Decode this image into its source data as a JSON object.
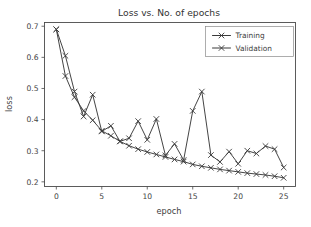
{
  "chart_data": {
    "type": "line",
    "title": "Loss vs. No. of epochs",
    "xlabel": "epoch",
    "ylabel": "loss",
    "xlim": [
      -1.3,
      26.3
    ],
    "ylim": [
      0.185,
      0.712
    ],
    "xticks": [
      0,
      5,
      10,
      15,
      20,
      25
    ],
    "xtick_labels": [
      "0",
      "5",
      "10",
      "15",
      "20",
      "25"
    ],
    "yticks": [
      0.2,
      0.3,
      0.4,
      0.5,
      0.6,
      0.7
    ],
    "ytick_labels": [
      "0.2",
      "0.3",
      "0.4",
      "0.5",
      "0.6",
      "0.7"
    ],
    "grid": false,
    "legend_position": "upper right",
    "marker": "x",
    "line_color": "#3a3a3a",
    "x": [
      0,
      1,
      2,
      3,
      4,
      5,
      6,
      7,
      8,
      9,
      10,
      11,
      12,
      13,
      14,
      15,
      16,
      17,
      18,
      19,
      20,
      21,
      22,
      23,
      24,
      25
    ],
    "series": [
      {
        "name": "Training",
        "values": [
          0.69,
          0.54,
          0.472,
          0.428,
          0.398,
          0.364,
          0.348,
          0.33,
          0.316,
          0.305,
          0.296,
          0.288,
          0.28,
          0.272,
          0.265,
          0.256,
          0.25,
          0.245,
          0.24,
          0.236,
          0.232,
          0.228,
          0.225,
          0.222,
          0.218,
          0.213
        ]
      },
      {
        "name": "Validation",
        "values": [
          0.69,
          0.605,
          0.49,
          0.41,
          0.48,
          0.362,
          0.38,
          0.33,
          0.34,
          0.395,
          0.335,
          0.402,
          0.285,
          0.322,
          0.27,
          0.428,
          0.49,
          0.286,
          0.264,
          0.297,
          0.258,
          0.3,
          0.291,
          0.315,
          0.305,
          0.246
        ]
      }
    ]
  },
  "legend": {
    "entries": [
      "Training",
      "Validation"
    ]
  }
}
